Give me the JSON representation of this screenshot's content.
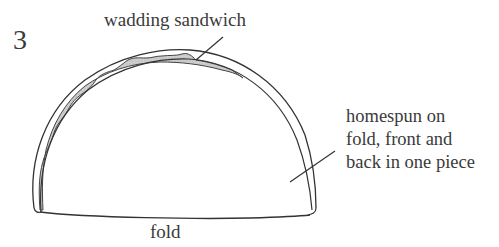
{
  "diagram": {
    "figure_number": "3",
    "labels": {
      "wadding": "wadding sandwich",
      "homespun_lines": [
        "homespun on",
        "fold, front and",
        "back in one piece"
      ],
      "fold": "fold"
    },
    "colors": {
      "stroke": "#333333",
      "wadding_fill": "#c8c8c8",
      "background": "#ffffff",
      "text": "#3a3a3a"
    },
    "shapes": [
      {
        "name": "outer-arc",
        "description": "outer homespun half-dome outline"
      },
      {
        "name": "inner-arc",
        "description": "inner homespun half-dome outline"
      },
      {
        "name": "wadding-layer",
        "description": "shaded wavy wadding sandwich between layers"
      },
      {
        "name": "fold-line",
        "description": "base fold line"
      },
      {
        "name": "wadding-leader",
        "description": "leader line to wadding sandwich"
      },
      {
        "name": "homespun-leader",
        "description": "leader line to homespun"
      }
    ]
  }
}
